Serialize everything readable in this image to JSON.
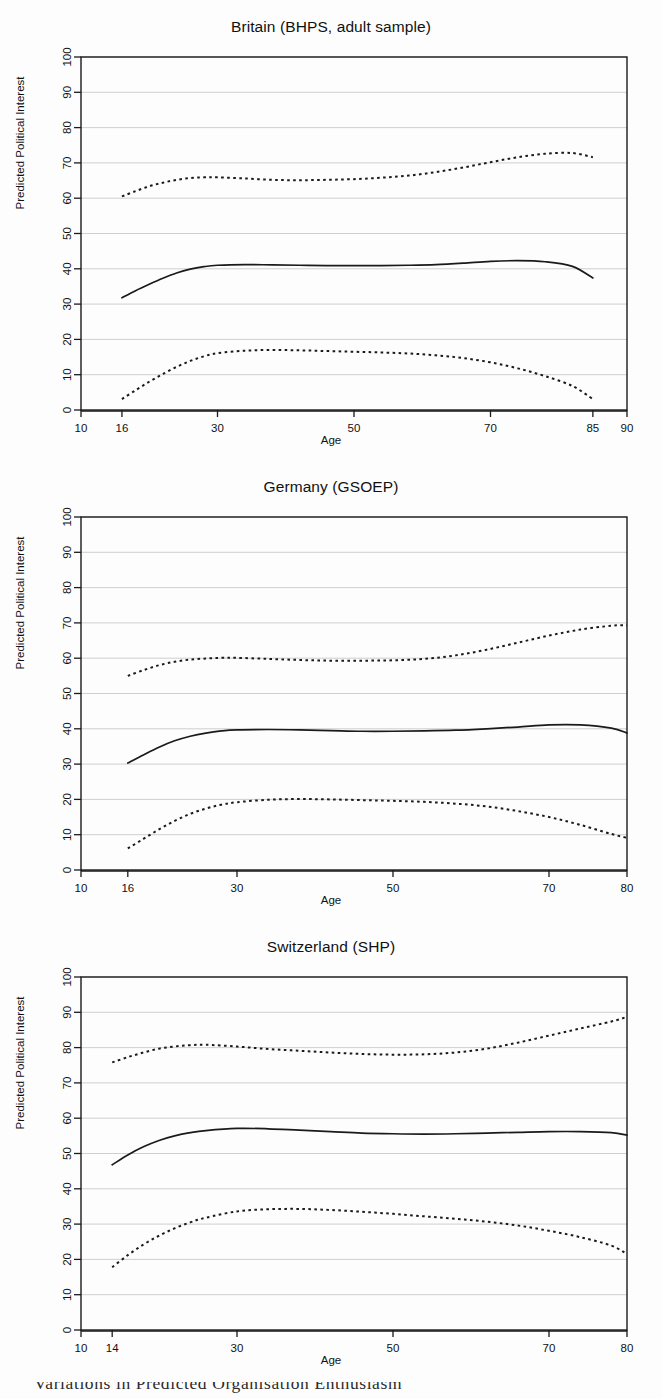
{
  "figure": {
    "background_color": "#fdfdfd",
    "axis_color": "#1a1a1a",
    "grid_color": "#c9c9c9",
    "line_color": "#1a1a1a",
    "x_axis_label": "Age",
    "y_axis_label": "Predicted Political Interest",
    "y_ticks": [
      0,
      10,
      20,
      30,
      40,
      50,
      60,
      70,
      80,
      90,
      100
    ],
    "caption_partial": "Variations in Predicted Organisation Enthusiasm"
  },
  "chart_data": [
    {
      "type": "line",
      "title": "Britain (BHPS, adult sample)",
      "xlabel": "Age",
      "ylabel": "Predicted Political Interest",
      "xlim": [
        10,
        90
      ],
      "ylim": [
        0,
        100
      ],
      "xticks": [
        10,
        16,
        30,
        50,
        70,
        85,
        90
      ],
      "yticks": [
        0,
        10,
        20,
        30,
        40,
        50,
        60,
        70,
        80,
        90,
        100
      ],
      "grid": true,
      "legend": "none",
      "series": [
        {
          "name": "upper-bound",
          "style": "dotted",
          "x": [
            16,
            18,
            20,
            22,
            24,
            26,
            28,
            30,
            34,
            38,
            42,
            46,
            50,
            54,
            58,
            62,
            66,
            70,
            74,
            78,
            82,
            85
          ],
          "values": [
            60.5,
            62.0,
            63.4,
            64.4,
            65.2,
            65.7,
            65.9,
            65.9,
            65.6,
            65.2,
            65.1,
            65.2,
            65.4,
            65.8,
            66.4,
            67.4,
            68.7,
            70.2,
            71.6,
            72.6,
            72.8,
            71.6
          ]
        },
        {
          "name": "predicted-mean",
          "style": "solid",
          "x": [
            16,
            18,
            20,
            22,
            24,
            26,
            28,
            30,
            34,
            38,
            42,
            46,
            50,
            54,
            58,
            62,
            66,
            70,
            74,
            78,
            82,
            85
          ],
          "values": [
            31.8,
            33.8,
            35.6,
            37.3,
            38.8,
            39.9,
            40.6,
            41.0,
            41.2,
            41.1,
            41.0,
            40.9,
            40.9,
            40.9,
            41.0,
            41.2,
            41.6,
            42.1,
            42.3,
            42.0,
            40.7,
            37.4
          ]
        },
        {
          "name": "lower-bound",
          "style": "dotted",
          "x": [
            16,
            18,
            20,
            22,
            24,
            26,
            28,
            30,
            34,
            38,
            42,
            46,
            50,
            54,
            58,
            62,
            66,
            70,
            74,
            78,
            82,
            85
          ],
          "values": [
            3.1,
            5.6,
            8.0,
            10.2,
            12.2,
            13.9,
            15.2,
            16.1,
            16.8,
            17.0,
            16.9,
            16.7,
            16.5,
            16.3,
            16.0,
            15.5,
            14.7,
            13.5,
            11.8,
            9.6,
            6.8,
            3.1
          ]
        }
      ]
    },
    {
      "type": "line",
      "title": "Germany (GSOEP)",
      "xlabel": "Age",
      "ylabel": "Predicted Political Interest",
      "xlim": [
        10,
        80
      ],
      "ylim": [
        0,
        100
      ],
      "xticks": [
        10,
        16,
        30,
        50,
        70,
        80
      ],
      "yticks": [
        0,
        10,
        20,
        30,
        40,
        50,
        60,
        70,
        80,
        90,
        100
      ],
      "grid": true,
      "legend": "none",
      "series": [
        {
          "name": "upper-bound",
          "style": "dotted",
          "x": [
            16,
            18,
            20,
            22,
            24,
            26,
            28,
            30,
            34,
            38,
            42,
            46,
            50,
            54,
            58,
            62,
            66,
            70,
            74,
            78,
            80
          ],
          "values": [
            55.0,
            56.6,
            58.0,
            59.0,
            59.6,
            59.9,
            60.1,
            60.1,
            59.8,
            59.5,
            59.3,
            59.3,
            59.4,
            59.8,
            60.8,
            62.4,
            64.4,
            66.4,
            68.1,
            69.2,
            69.3
          ]
        },
        {
          "name": "predicted-mean",
          "style": "solid",
          "x": [
            16,
            18,
            20,
            22,
            24,
            26,
            28,
            30,
            34,
            38,
            42,
            46,
            50,
            54,
            58,
            62,
            66,
            70,
            74,
            78,
            80
          ],
          "values": [
            30.3,
            32.6,
            34.8,
            36.6,
            37.9,
            38.8,
            39.4,
            39.7,
            39.8,
            39.7,
            39.5,
            39.3,
            39.3,
            39.4,
            39.6,
            40.0,
            40.5,
            41.1,
            41.1,
            40.2,
            38.8
          ]
        },
        {
          "name": "lower-bound",
          "style": "dotted",
          "x": [
            16,
            18,
            20,
            22,
            24,
            26,
            28,
            30,
            34,
            38,
            42,
            46,
            50,
            54,
            58,
            62,
            66,
            70,
            74,
            78,
            80
          ],
          "values": [
            6.1,
            8.8,
            11.5,
            13.9,
            15.9,
            17.4,
            18.5,
            19.2,
            19.9,
            20.1,
            20.0,
            19.8,
            19.6,
            19.3,
            18.8,
            18.0,
            16.7,
            15.0,
            12.8,
            10.2,
            9.1
          ]
        }
      ]
    },
    {
      "type": "line",
      "title": "Switzerland (SHP)",
      "xlabel": "Age",
      "ylabel": "Predicted Political Interest",
      "xlim": [
        10,
        80
      ],
      "ylim": [
        0,
        100
      ],
      "xticks": [
        10,
        14,
        30,
        50,
        70,
        80
      ],
      "yticks": [
        0,
        10,
        20,
        30,
        40,
        50,
        60,
        70,
        80,
        90,
        100
      ],
      "grid": true,
      "legend": "none",
      "series": [
        {
          "name": "upper-bound",
          "style": "dotted",
          "x": [
            14,
            16,
            18,
            20,
            22,
            24,
            26,
            30,
            34,
            38,
            42,
            46,
            50,
            54,
            58,
            62,
            66,
            70,
            74,
            78,
            80
          ],
          "values": [
            75.8,
            77.3,
            78.6,
            79.7,
            80.3,
            80.7,
            80.8,
            80.3,
            79.6,
            79.1,
            78.6,
            78.2,
            78.0,
            78.1,
            78.6,
            79.7,
            81.4,
            83.4,
            85.4,
            87.4,
            88.7
          ]
        },
        {
          "name": "predicted-mean",
          "style": "solid",
          "x": [
            14,
            16,
            18,
            20,
            22,
            24,
            26,
            30,
            34,
            38,
            42,
            46,
            50,
            54,
            58,
            62,
            66,
            70,
            74,
            78,
            80
          ],
          "values": [
            46.8,
            49.6,
            51.9,
            53.7,
            55.0,
            55.9,
            56.5,
            57.1,
            57.0,
            56.6,
            56.2,
            55.8,
            55.6,
            55.5,
            55.6,
            55.8,
            56.0,
            56.2,
            56.2,
            55.9,
            55.2
          ]
        },
        {
          "name": "lower-bound",
          "style": "dotted",
          "x": [
            14,
            16,
            18,
            20,
            22,
            24,
            26,
            30,
            34,
            38,
            42,
            46,
            50,
            54,
            58,
            62,
            66,
            70,
            74,
            78,
            80
          ],
          "values": [
            17.8,
            21.2,
            24.2,
            26.7,
            28.8,
            30.5,
            31.8,
            33.6,
            34.2,
            34.3,
            34.0,
            33.5,
            32.9,
            32.2,
            31.5,
            30.7,
            29.6,
            28.1,
            26.3,
            23.9,
            21.5
          ]
        }
      ]
    }
  ]
}
